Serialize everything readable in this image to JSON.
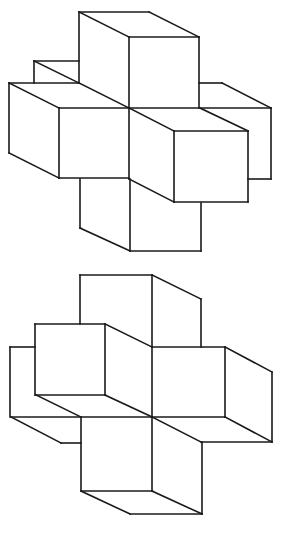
{
  "figures": [
    {
      "name": "cross-of-cubes-top",
      "description": "Isometric line drawing of six cubes arranged in a 3D cross, viewed from above",
      "stroke_color": "#1a1a1a",
      "segments": [
        [
          79,
          12,
          149,
          12
        ],
        [
          149,
          12,
          199,
          37
        ],
        [
          79,
          12,
          129,
          37
        ],
        [
          129,
          37,
          199,
          37
        ],
        [
          79,
          12,
          79,
          83
        ],
        [
          129,
          37,
          129,
          108
        ],
        [
          199,
          37,
          199,
          108
        ],
        [
          34,
          61,
          79,
          61
        ],
        [
          34,
          61,
          34,
          83
        ],
        [
          34,
          61,
          79,
          83
        ],
        [
          9,
          83,
          79,
          83
        ],
        [
          9,
          83,
          59,
          108
        ],
        [
          79,
          83,
          129,
          108
        ],
        [
          59,
          108,
          129,
          108
        ],
        [
          9,
          83,
          9,
          153
        ],
        [
          59,
          108,
          59,
          178
        ],
        [
          9,
          153,
          59,
          178
        ],
        [
          59,
          178,
          129,
          178
        ],
        [
          129,
          108,
          129,
          179
        ],
        [
          199,
          83,
          222,
          83
        ],
        [
          222,
          83,
          271,
          108
        ],
        [
          129,
          108,
          271,
          108
        ],
        [
          271,
          108,
          271,
          179
        ],
        [
          248,
          179,
          271,
          179
        ],
        [
          129,
          108,
          174,
          131
        ],
        [
          200,
          108,
          248,
          131
        ],
        [
          174,
          131,
          248,
          131
        ],
        [
          174,
          131,
          174,
          202
        ],
        [
          248,
          131,
          248,
          202
        ],
        [
          174,
          202,
          248,
          202
        ],
        [
          129,
          179,
          174,
          202
        ],
        [
          80,
          179,
          80,
          228
        ],
        [
          80,
          228,
          130,
          251
        ],
        [
          130,
          179,
          130,
          251
        ],
        [
          130,
          251,
          201,
          251
        ],
        [
          201,
          203,
          201,
          251
        ]
      ]
    },
    {
      "name": "cross-of-cubes-bottom",
      "description": "Isometric line drawing of six cubes arranged in a 3D cross, viewed from below",
      "stroke_color": "#1a1a1a",
      "segments": [
        [
          80,
          275,
          152,
          275
        ],
        [
          80,
          275,
          80,
          324
        ],
        [
          152,
          275,
          152,
          347
        ],
        [
          152,
          275,
          201,
          299
        ],
        [
          201,
          299,
          201,
          347
        ],
        [
          35,
          324,
          105,
          324
        ],
        [
          35,
          324,
          35,
          395
        ],
        [
          105,
          324,
          105,
          395
        ],
        [
          105,
          324,
          152,
          347
        ],
        [
          35,
          395,
          105,
          395
        ],
        [
          10,
          347,
          35,
          347
        ],
        [
          10,
          347,
          10,
          417
        ],
        [
          152,
          347,
          225,
          347
        ],
        [
          225,
          347,
          272,
          372
        ],
        [
          272,
          372,
          272,
          442
        ],
        [
          225,
          347,
          225,
          417
        ],
        [
          152,
          417,
          225,
          417
        ],
        [
          225,
          417,
          272,
          442
        ],
        [
          152,
          417,
          201,
          442
        ],
        [
          201,
          442,
          272,
          442
        ],
        [
          11,
          417,
          152,
          417
        ],
        [
          11,
          417,
          61,
          443
        ],
        [
          61,
          443,
          81,
          443
        ],
        [
          36,
          395,
          81,
          417
        ],
        [
          105,
          395,
          152,
          417
        ],
        [
          81,
          417,
          81,
          491
        ],
        [
          152,
          347,
          152,
          491
        ],
        [
          81,
          491,
          152,
          491
        ],
        [
          81,
          491,
          130,
          514
        ],
        [
          130,
          514,
          202,
          514
        ],
        [
          152,
          491,
          202,
          514
        ],
        [
          202,
          442,
          202,
          514
        ]
      ]
    }
  ]
}
